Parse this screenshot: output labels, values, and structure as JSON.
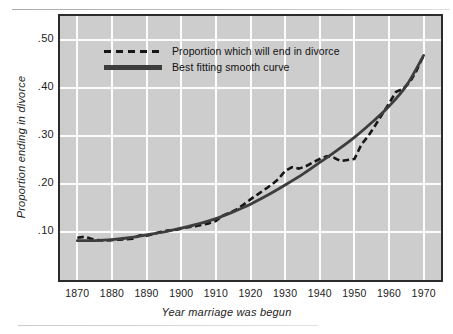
{
  "figure": {
    "background_color": "#ffffff",
    "plot_background_color": "#cdcdcd",
    "grid_color": "#fdfdfd",
    "frame_color": "#2b2b2b"
  },
  "axes": {
    "x_title": "Year marriage was begun",
    "y_title": "Proportion ending in divorce",
    "x_ticks": [
      "1870",
      "1880",
      "1890",
      "1900",
      "1910",
      "1920",
      "1930",
      "1940",
      "1950",
      "1960",
      "1970"
    ],
    "y_ticks": [
      ".50",
      ".40",
      ".30",
      ".20",
      ".10"
    ]
  },
  "legend": {
    "items": [
      {
        "label": "Proportion which will end in divorce",
        "style": "dashed",
        "color": "#161616"
      },
      {
        "label": "Best fitting smooth curve",
        "style": "solid",
        "color": "#3d3d3d"
      }
    ]
  },
  "chart_data": {
    "type": "line",
    "title": "",
    "xlabel": "Year marriage was begun",
    "ylabel": "Proportion ending in divorce",
    "xlim": [
      1865,
      1975
    ],
    "ylim": [
      0.0,
      0.55
    ],
    "xticks": [
      1870,
      1880,
      1890,
      1900,
      1910,
      1920,
      1930,
      1940,
      1950,
      1960,
      1970
    ],
    "yticks": [
      0.1,
      0.2,
      0.3,
      0.4,
      0.5
    ],
    "ytick_labels": [
      ".10",
      ".20",
      ".30",
      ".40",
      ".50"
    ],
    "grid": true,
    "legend_position": "upper left",
    "series": [
      {
        "name": "Proportion which will end in divorce",
        "style": "dashed",
        "color": "#161616",
        "x": [
          1870,
          1872,
          1874,
          1876,
          1878,
          1880,
          1882,
          1884,
          1886,
          1888,
          1890,
          1892,
          1894,
          1896,
          1898,
          1900,
          1902,
          1904,
          1906,
          1908,
          1910,
          1912,
          1914,
          1916,
          1918,
          1920,
          1922,
          1924,
          1926,
          1928,
          1930,
          1932,
          1934,
          1936,
          1938,
          1940,
          1942,
          1944,
          1946,
          1948,
          1950,
          1952,
          1954,
          1956,
          1958,
          1960,
          1962,
          1964,
          1966,
          1968,
          1970
        ],
        "y": [
          0.088,
          0.09,
          0.086,
          0.083,
          0.082,
          0.083,
          0.084,
          0.085,
          0.086,
          0.093,
          0.092,
          0.096,
          0.1,
          0.103,
          0.104,
          0.107,
          0.11,
          0.112,
          0.115,
          0.118,
          0.123,
          0.134,
          0.14,
          0.147,
          0.157,
          0.168,
          0.178,
          0.188,
          0.198,
          0.21,
          0.227,
          0.235,
          0.232,
          0.237,
          0.245,
          0.252,
          0.258,
          0.255,
          0.248,
          0.25,
          0.252,
          0.282,
          0.3,
          0.322,
          0.345,
          0.368,
          0.392,
          0.398,
          0.412,
          0.437,
          0.468
        ]
      },
      {
        "name": "Best fitting smooth curve",
        "style": "solid",
        "color": "#3d3d3d",
        "x": [
          1870,
          1875,
          1880,
          1885,
          1890,
          1895,
          1900,
          1905,
          1910,
          1915,
          1920,
          1925,
          1930,
          1935,
          1940,
          1945,
          1950,
          1955,
          1960,
          1965,
          1970
        ],
        "y": [
          0.082,
          0.082,
          0.084,
          0.088,
          0.094,
          0.1,
          0.108,
          0.117,
          0.128,
          0.142,
          0.158,
          0.177,
          0.198,
          0.22,
          0.245,
          0.27,
          0.297,
          0.328,
          0.362,
          0.405,
          0.468
        ]
      }
    ]
  }
}
